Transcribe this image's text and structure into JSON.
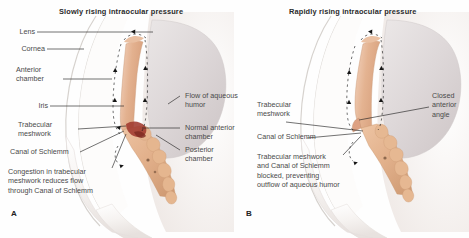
{
  "figure": {
    "panelA": {
      "letter": "A",
      "title": "Slowly rising intraocular pressure",
      "labels": {
        "lens": "Lens",
        "cornea": "Cornea",
        "anterior_chamber": "Anterior\nchamber",
        "iris": "Iris",
        "trabecular_meshwork": "Trabecular\nmeshwork",
        "canal_of_schlemm": "Canal of Schlemm",
        "congestion_note": "Congestion in trabecular\nmeshwork reduces flow\nthrough Canal of Schlemm",
        "flow_of_aqueous_humor": "Flow of aqueous\nhumor",
        "normal_anterior_chamber": "Normal anterior\nchamber",
        "posterior_chamber": "Posterior\nchamber"
      }
    },
    "panelB": {
      "letter": "B",
      "title": "Rapidly rising intraocular pressure",
      "labels": {
        "trabecular_meshwork": "Trabecular\nmeshwork",
        "canal_of_schlemm": "Canal of Schlemm",
        "blocked_note": "Trabecular meshwork\nand Canal of Schlemm\nblocked, preventing\noutflow of aqueous humor",
        "closed_anterior_angle": "Closed\nanterior\nangle"
      }
    },
    "colors": {
      "background": "#fefefe",
      "title_text": "#2b2b2b",
      "label_text": "#4a4a4a",
      "leader_line": "#1c1c1c",
      "sclera": "#f7f5f3",
      "cornea_stroke": "#d8d4d0",
      "lens": "#ded9d9",
      "iris": "#e6b496",
      "ciliary_body": "#e0b392",
      "congestion": "#a0392e",
      "arrow": "#1a1a1a"
    }
  }
}
